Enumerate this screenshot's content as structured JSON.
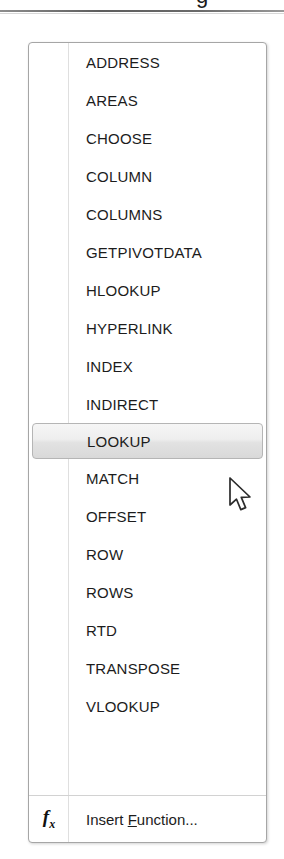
{
  "top_remnant": {
    "cut_glyph": "g"
  },
  "menu": {
    "name": "lookup-and-reference-function-menu",
    "items": [
      {
        "label": "ADDRESS",
        "selected": false
      },
      {
        "label": "AREAS",
        "selected": false
      },
      {
        "label": "CHOOSE",
        "selected": false
      },
      {
        "label": "COLUMN",
        "selected": false
      },
      {
        "label": "COLUMNS",
        "selected": false
      },
      {
        "label": "GETPIVOTDATA",
        "selected": false
      },
      {
        "label": "HLOOKUP",
        "selected": false
      },
      {
        "label": "HYPERLINK",
        "selected": false
      },
      {
        "label": "INDEX",
        "selected": false
      },
      {
        "label": "INDIRECT",
        "selected": false
      },
      {
        "label": "LOOKUP",
        "selected": true
      },
      {
        "label": "MATCH",
        "selected": false
      },
      {
        "label": "OFFSET",
        "selected": false
      },
      {
        "label": "ROW",
        "selected": false
      },
      {
        "label": "ROWS",
        "selected": false
      },
      {
        "label": "RTD",
        "selected": false
      },
      {
        "label": "TRANSPOSE",
        "selected": false
      },
      {
        "label": "VLOOKUP",
        "selected": false
      }
    ],
    "footer": {
      "icon": "fx-icon",
      "icon_text": "f",
      "icon_subscript": "x",
      "label_before": "Insert ",
      "label_accesskey": "F",
      "label_after": "unction..."
    }
  },
  "cursor": {
    "type": "arrow-pointer",
    "x": 228,
    "y": 477
  },
  "colors": {
    "panel_border": "#a6a6a6",
    "panel_background": "#ffffff",
    "gutter_divider": "#dfdfdf",
    "text": "#1c1c1c",
    "highlight_top": "#f6f6f6",
    "highlight_bottom": "#d9d9d9",
    "highlight_border": "#b5b5b5",
    "separator": "#d2d2d2"
  }
}
